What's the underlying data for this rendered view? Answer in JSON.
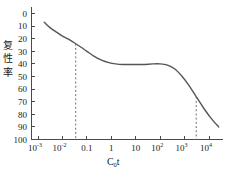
{
  "chart_data": {
    "type": "line",
    "title": "",
    "xlabel": "C₀t",
    "ylabel": "复性率",
    "ylabel_chars": [
      "复",
      "性",
      "率"
    ],
    "x_scale": "log",
    "xlim": [
      0.001,
      30000
    ],
    "ylim": [
      0,
      100
    ],
    "y_inverted": true,
    "grid": false,
    "legend": null,
    "xtick_labels": [
      "10⁻³",
      "10⁻²",
      "0.1",
      "1",
      "10",
      "10²",
      "10³",
      "10⁴"
    ],
    "xticks": [
      {
        "base": "10",
        "exp": "-3",
        "value": 0.001
      },
      {
        "base": "10",
        "exp": "-2",
        "value": 0.01
      },
      {
        "base": "0.1",
        "exp": "",
        "value": 0.1
      },
      {
        "base": "1",
        "exp": "",
        "value": 1
      },
      {
        "base": "10",
        "exp": "",
        "value": 10
      },
      {
        "base": "10",
        "exp": "2",
        "value": 100
      },
      {
        "base": "10",
        "exp": "3",
        "value": 1000
      },
      {
        "base": "10",
        "exp": "4",
        "value": 10000
      }
    ],
    "ytick_labels": [
      "0",
      "10",
      "20",
      "30",
      "40",
      "50",
      "60",
      "70",
      "80",
      "90",
      "100"
    ],
    "yticks": [
      0,
      10,
      20,
      30,
      40,
      50,
      60,
      70,
      80,
      90,
      100
    ],
    "series": [
      {
        "name": "renaturation curve",
        "color": "#555555",
        "points": [
          [
            0.0018,
            7
          ],
          [
            0.003,
            11
          ],
          [
            0.006,
            15
          ],
          [
            0.01,
            18
          ],
          [
            0.02,
            21
          ],
          [
            0.035,
            24
          ],
          [
            0.06,
            27
          ],
          [
            0.1,
            30
          ],
          [
            0.2,
            34
          ],
          [
            0.4,
            37
          ],
          [
            0.8,
            39
          ],
          [
            1.5,
            40
          ],
          [
            3,
            40.5
          ],
          [
            8,
            40.5
          ],
          [
            20,
            40.5
          ],
          [
            50,
            40
          ],
          [
            100,
            40
          ],
          [
            200,
            41
          ],
          [
            400,
            44
          ],
          [
            800,
            50
          ],
          [
            1500,
            57
          ],
          [
            3000,
            66
          ],
          [
            6000,
            75
          ],
          [
            12000,
            83
          ],
          [
            25000,
            90
          ]
        ]
      }
    ],
    "annotations": [
      {
        "name": "left-guide",
        "type": "vertical-dashed",
        "x": 0.035,
        "y_from": 24,
        "y_to": 100
      },
      {
        "name": "right-guide",
        "type": "vertical-dashed",
        "x": 3000,
        "y_from": 66,
        "y_to": 100
      }
    ]
  }
}
